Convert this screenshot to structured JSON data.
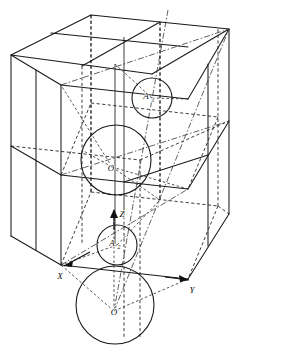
{
  "figure": {
    "background_color": "#ffffff",
    "line_color": "#1a1a1a",
    "width": 281,
    "height": 352
  },
  "axes": [
    {
      "id": "x",
      "label": "X",
      "label_x": 60,
      "label_y": 277,
      "tip_x": 66,
      "tip_y": 266,
      "arrow": true
    },
    {
      "id": "y",
      "label": "Y",
      "label_x": 192,
      "label_y": 292,
      "tip_x": 190,
      "tip_y": 282,
      "arrow": true
    },
    {
      "id": "z",
      "label": "Z",
      "label_x": 120,
      "label_y": 215,
      "tip_x": 114,
      "tip_y": 211,
      "arrow": true
    }
  ],
  "points": [
    {
      "id": "o-centre",
      "label": "O",
      "x": 112,
      "y": 167,
      "kind": "body-centre-origin"
    },
    {
      "id": "o-lower",
      "label": "O",
      "x": 114,
      "y": 311,
      "kind": "corner-origin"
    },
    {
      "id": "a-upper",
      "label": "A",
      "subscript": "1",
      "x": 148,
      "y": 96,
      "kind": "octant-centre"
    },
    {
      "id": "a-lower",
      "label": "A",
      "subscript": "2",
      "x": 114,
      "y": 243,
      "kind": "octant-centre"
    }
  ],
  "circles": [
    {
      "id": "sphere-body-centre",
      "cx": 116,
      "cy": 160,
      "r": 35,
      "label_ref": "o-centre"
    },
    {
      "id": "sphere-upper-octant",
      "cx": 152,
      "cy": 98,
      "r": 20,
      "label_ref": "a-upper"
    },
    {
      "id": "sphere-lower-octant",
      "cx": 117,
      "cy": 245,
      "r": 20,
      "label_ref": "a-lower"
    },
    {
      "id": "sphere-corner-origin",
      "cx": 115,
      "cy": 305,
      "r": 39,
      "label_ref": "o-lower"
    }
  ],
  "cube": {
    "subdivision": "2x2x2 octants",
    "front_top_left": [
      61,
      52
    ],
    "front_top_right": [
      188,
      52
    ],
    "back_top_left": [
      11,
      52
    ],
    "visible_faces": 3,
    "hidden_edge_style": "dashed"
  },
  "legend": {
    "solid_lines": "visible edges",
    "dashed_lines": "hidden edges and construction lines",
    "chain_lines": "diagonal reference directions"
  }
}
